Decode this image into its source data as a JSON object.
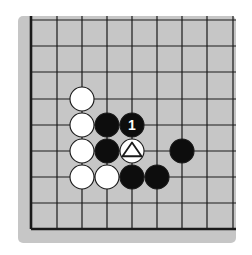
{
  "diagram": {
    "type": "go-board-fragment",
    "corner": "bottom-left",
    "colors": {
      "page_background": "#ffffff",
      "board_background": "#c6c6c6",
      "grid_line": "#1a1a1a",
      "black_stone": "#0d0d0d",
      "white_stone": "#ffffff",
      "stone_outline": "#1a1a1a",
      "label_on_black": "#ffffff",
      "marker_on_white": "#1a1a1a"
    },
    "board_rect": {
      "x": 18,
      "y": 16,
      "width": 218,
      "height": 227,
      "radius": 5
    },
    "grid": {
      "x_lines": [
        31,
        57,
        82,
        107,
        132,
        157,
        182,
        207,
        233
      ],
      "y_lines": [
        20,
        46,
        72,
        99,
        125,
        151,
        177,
        203,
        229
      ],
      "thick_edges": [
        "left",
        "bottom"
      ],
      "open_edges": [
        "top",
        "right"
      ]
    },
    "stone_radius": 12,
    "stones": [
      {
        "color": "white",
        "col": 2,
        "row": 3,
        "label": "",
        "marker": ""
      },
      {
        "color": "white",
        "col": 2,
        "row": 4,
        "label": "",
        "marker": ""
      },
      {
        "color": "white",
        "col": 2,
        "row": 5,
        "label": "",
        "marker": ""
      },
      {
        "color": "white",
        "col": 2,
        "row": 6,
        "label": "",
        "marker": ""
      },
      {
        "color": "white",
        "col": 3,
        "row": 6,
        "label": "",
        "marker": ""
      },
      {
        "color": "white",
        "col": 4,
        "row": 5,
        "label": "",
        "marker": "triangle"
      },
      {
        "color": "black",
        "col": 3,
        "row": 4,
        "label": "",
        "marker": ""
      },
      {
        "color": "black",
        "col": 4,
        "row": 4,
        "label": "1",
        "marker": ""
      },
      {
        "color": "black",
        "col": 3,
        "row": 5,
        "label": "",
        "marker": ""
      },
      {
        "color": "black",
        "col": 4,
        "row": 6,
        "label": "",
        "marker": ""
      },
      {
        "color": "black",
        "col": 5,
        "row": 6,
        "label": "",
        "marker": ""
      },
      {
        "color": "black",
        "col": 6,
        "row": 5,
        "label": "",
        "marker": ""
      }
    ]
  }
}
